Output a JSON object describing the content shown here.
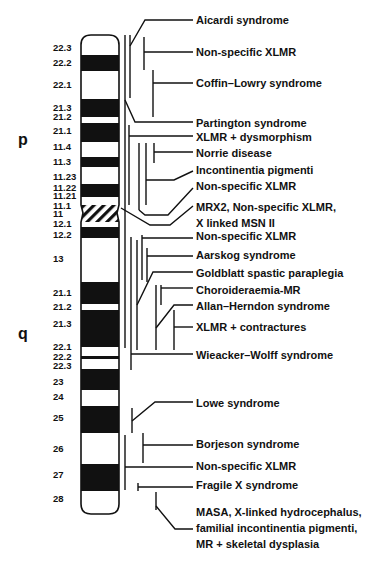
{
  "figure": {
    "arms": [
      {
        "label": "p",
        "x": 18,
        "y": 145
      },
      {
        "label": "q",
        "x": 18,
        "y": 339
      }
    ],
    "chromosome": {
      "x": 81,
      "width": 38,
      "top": 35,
      "bottom": 514,
      "bands": [
        {
          "name": "22.3",
          "y1": 35,
          "y2": 55,
          "fill": "white",
          "label_y": 51
        },
        {
          "name": "22.2",
          "y1": 55,
          "y2": 71,
          "fill": "black",
          "label_y": 66
        },
        {
          "name": "22.1",
          "y1": 71,
          "y2": 99,
          "fill": "white",
          "label_y": 88
        },
        {
          "name": "21.3",
          "y1": 99,
          "y2": 117,
          "fill": "black",
          "label_y": 111
        },
        {
          "name": "21.2",
          "y1": 117,
          "y2": 123,
          "fill": "white",
          "label_y": 120
        },
        {
          "name": "21.1",
          "y1": 123,
          "y2": 142,
          "fill": "black",
          "label_y": 134
        },
        {
          "name": "11.4",
          "y1": 142,
          "y2": 157,
          "fill": "white",
          "label_y": 150
        },
        {
          "name": "11.3",
          "y1": 157,
          "y2": 167,
          "fill": "black",
          "label_y": 165
        },
        {
          "name": "11.23",
          "y1": 167,
          "y2": 184,
          "fill": "white",
          "label_y": 180
        },
        {
          "name": "11.22",
          "y1": 184,
          "y2": 197,
          "fill": "black",
          "label_y": 191
        },
        {
          "name": "11.21",
          "y1": 197,
          "y2": 205,
          "fill": "white",
          "label_y": 199
        },
        {
          "name": "11.1",
          "y1": 205,
          "y2": 214,
          "fill": "hatch",
          "label_y": 209
        },
        {
          "name": "11",
          "y1": 214,
          "y2": 222,
          "fill": "hatch",
          "label_y": 217
        },
        {
          "name": "12.1",
          "y1": 222,
          "y2": 227,
          "fill": "white",
          "label_y": 227
        },
        {
          "name": "12.2",
          "y1": 227,
          "y2": 238,
          "fill": "black",
          "label_y": 238
        },
        {
          "name": "13",
          "y1": 238,
          "y2": 282,
          "fill": "white",
          "label_y": 262
        },
        {
          "name": "21.1",
          "y1": 282,
          "y2": 304,
          "fill": "black",
          "label_y": 296
        },
        {
          "name": "21.2",
          "y1": 304,
          "y2": 310,
          "fill": "white",
          "label_y": 310
        },
        {
          "name": "21.3",
          "y1": 310,
          "y2": 347,
          "fill": "black",
          "label_y": 327
        },
        {
          "name": "22.1",
          "y1": 347,
          "y2": 356,
          "fill": "white",
          "label_y": 350
        },
        {
          "name": "22.2",
          "y1": 356,
          "y2": 359,
          "fill": "black",
          "label_y": 360
        },
        {
          "name": "22.3",
          "y1": 359,
          "y2": 369,
          "fill": "white",
          "label_y": 369
        },
        {
          "name": "23",
          "y1": 369,
          "y2": 390,
          "fill": "black",
          "label_y": 385
        },
        {
          "name": "24",
          "y1": 390,
          "y2": 406,
          "fill": "white",
          "label_y": 400
        },
        {
          "name": "25",
          "y1": 406,
          "y2": 433,
          "fill": "black",
          "label_y": 421
        },
        {
          "name": "26",
          "y1": 433,
          "y2": 464,
          "fill": "white",
          "label_y": 452
        },
        {
          "name": "27",
          "y1": 464,
          "y2": 491,
          "fill": "black",
          "label_y": 478
        },
        {
          "name": "28",
          "y1": 491,
          "y2": 514,
          "fill": "white",
          "label_y": 502
        }
      ]
    },
    "diseases": [
      {
        "id": "aicardi",
        "lines": [
          "Aicardi syndrome"
        ],
        "label_y": 24
      },
      {
        "id": "nonspecific-xlmr-1",
        "lines": [
          "Non-specific XLMR"
        ],
        "label_y": 56
      },
      {
        "id": "coffin-lowry",
        "lines": [
          "Coffin–Lowry syndrome"
        ],
        "label_y": 87
      },
      {
        "id": "partington",
        "lines": [
          "Partington syndrome"
        ],
        "label_y": 127
      },
      {
        "id": "xlmr-dysmorphism",
        "lines": [
          "XLMR + dysmorphism"
        ],
        "label_y": 141
      },
      {
        "id": "norrie",
        "lines": [
          "Norrie disease"
        ],
        "label_y": 157
      },
      {
        "id": "incontinentia-pigmenti",
        "lines": [
          "Incontinentia pigmenti"
        ],
        "label_y": 174
      },
      {
        "id": "nonspecific-xlmr-2",
        "lines": [
          "Non-specific XLMR"
        ],
        "label_y": 190
      },
      {
        "id": "mrx2",
        "lines": [
          "MRX2, Non-specific XLMR,",
          "X linked MSN II"
        ],
        "label_y": 211
      },
      {
        "id": "nonspecific-xlmr-3",
        "lines": [
          "Non-specific XLMR"
        ],
        "label_y": 240
      },
      {
        "id": "aarskog",
        "lines": [
          "Aarskog syndrome"
        ],
        "label_y": 259
      },
      {
        "id": "goldblatt",
        "lines": [
          "Goldblatt spastic paraplegia"
        ],
        "label_y": 277
      },
      {
        "id": "choroideraemia",
        "lines": [
          "Choroideraemia-MR"
        ],
        "label_y": 294
      },
      {
        "id": "allan-herndon",
        "lines": [
          "Allan–Herndon syndrome"
        ],
        "label_y": 310
      },
      {
        "id": "xlmr-contractures",
        "lines": [
          "XLMR + contractures"
        ],
        "label_y": 331
      },
      {
        "id": "wieacker-wolff",
        "lines": [
          "Wieacker–Wolff syndrome"
        ],
        "label_y": 359
      },
      {
        "id": "lowe",
        "lines": [
          "Lowe syndrome"
        ],
        "label_y": 407
      },
      {
        "id": "borjeson",
        "lines": [
          "Borjeson syndrome"
        ],
        "label_y": 448
      },
      {
        "id": "nonspecific-xlmr-4",
        "lines": [
          "Non-specific XLMR"
        ],
        "label_y": 470
      },
      {
        "id": "fragile-x",
        "lines": [
          "Fragile X syndrome"
        ],
        "label_y": 489
      },
      {
        "id": "masa",
        "lines": [
          "MASA, X-linked hydrocephalus,",
          "familial incontinentia pigmenti,",
          "MR + skeletal dysplasia"
        ],
        "label_y": 516
      }
    ],
    "label_x": 196,
    "line_height": 16
  }
}
